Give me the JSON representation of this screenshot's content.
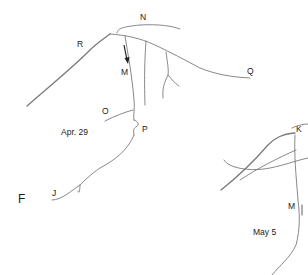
{
  "figure": {
    "panel_label": "F",
    "panels": [
      {
        "date": "Apr. 29",
        "labels": [
          "N",
          "R",
          "M",
          "Q",
          "O",
          "P",
          "J"
        ]
      },
      {
        "date": "May 5",
        "labels": [
          "K",
          "M"
        ]
      }
    ],
    "arrow": "down-arrow",
    "colors": {
      "line": "#7a7a7a",
      "text": "#1a1a1a",
      "background": "#ffffff"
    }
  }
}
